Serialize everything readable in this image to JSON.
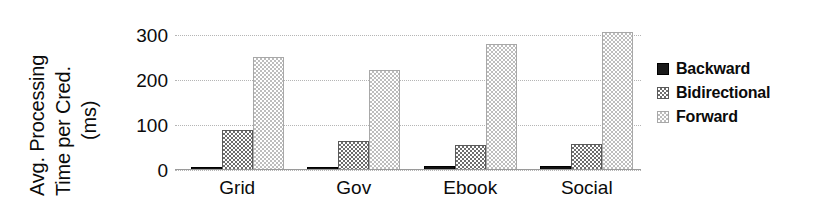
{
  "chart_data": {
    "type": "bar",
    "title": "",
    "xlabel": "",
    "ylabel": "Avg. Processing Time per Cred. (ms)",
    "ylabel_lines": [
      "Avg. Processing",
      "Time per Cred.",
      "(ms)"
    ],
    "categories": [
      "Grid",
      "Gov",
      "Ebook",
      "Social"
    ],
    "series": [
      {
        "name": "Backward",
        "values": [
          5,
          6,
          8,
          8
        ],
        "color": "#1a1a1a",
        "fill": "solid-black"
      },
      {
        "name": "Bidirectional",
        "values": [
          90,
          65,
          55,
          57
        ],
        "color": "#6d6d6d",
        "fill": "dither-50"
      },
      {
        "name": "Forward",
        "values": [
          252,
          223,
          281,
          307
        ],
        "color": "#bdbdbd",
        "fill": "dither-25"
      }
    ],
    "ylim": [
      0,
      320
    ],
    "yticks": [
      0,
      100,
      200,
      300
    ],
    "ytick_labels": [
      "0",
      "100",
      "200",
      "300"
    ],
    "grid": true,
    "grid_style": "dotted-horizontal",
    "legend_position": "right",
    "units": "ms"
  },
  "legend": {
    "items": [
      {
        "label": "Backward",
        "swatch": "black-square-icon"
      },
      {
        "label": "Bidirectional",
        "swatch": "dark-gray-square-icon"
      },
      {
        "label": "Forward",
        "swatch": "light-gray-square-icon"
      }
    ]
  }
}
